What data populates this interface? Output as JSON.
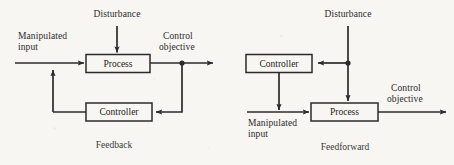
{
  "figure": {
    "ink_color": "#2b2b2b",
    "paper_color": "#f7f6f2"
  },
  "diagrams": [
    {
      "id": "feedback",
      "caption": "Feedback",
      "blocks": [
        {
          "name": "process",
          "label": "Process"
        },
        {
          "name": "controller",
          "label": "Controller"
        }
      ],
      "labels": {
        "disturbance": "Disturbance",
        "manipulated_input_line1": "Manipulated",
        "manipulated_input_line2": "input",
        "control_objective_line1": "Control",
        "control_objective_line2": "objective"
      }
    },
    {
      "id": "feedforward",
      "caption": "Feedforward",
      "blocks": [
        {
          "name": "controller",
          "label": "Controller"
        },
        {
          "name": "process",
          "label": "Process"
        }
      ],
      "labels": {
        "disturbance": "Disturbance",
        "manipulated_input_line1": "Manipulated",
        "manipulated_input_line2": "input",
        "control_objective_line1": "Control",
        "control_objective_line2": "objective"
      }
    }
  ]
}
